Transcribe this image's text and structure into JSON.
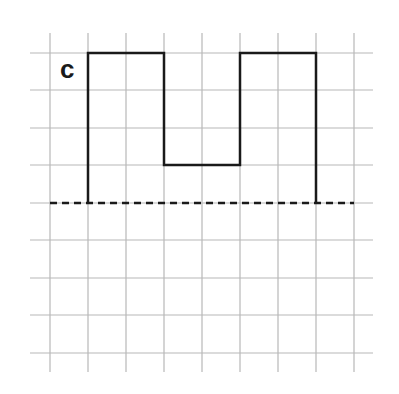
{
  "figure": {
    "label": "c",
    "grid": {
      "columns_x": [
        50,
        88,
        126,
        164,
        202,
        240,
        278,
        316,
        354
      ],
      "rows_y": [
        53,
        90,
        128,
        165,
        203,
        240,
        278,
        315,
        353
      ],
      "h_extent": [
        30,
        373
      ],
      "v_extent": [
        33,
        372
      ],
      "color": "#b8b8b8"
    },
    "shape": {
      "description": "square-wave outline above baseline",
      "points": [
        [
          88,
          203
        ],
        [
          88,
          53
        ],
        [
          164,
          53
        ],
        [
          164,
          165
        ],
        [
          240,
          165
        ],
        [
          240,
          53
        ],
        [
          316,
          53
        ],
        [
          316,
          203
        ]
      ],
      "color": "#1a1a1a"
    },
    "baseline": {
      "style": "dashed",
      "y": 203,
      "x_range": [
        50,
        354
      ],
      "color": "#1a1a1a"
    }
  }
}
